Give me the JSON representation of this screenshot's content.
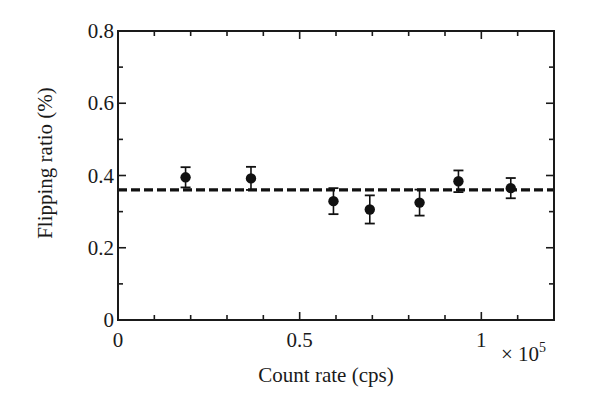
{
  "chart_data": {
    "type": "scatter",
    "title": "",
    "xlabel": "Count rate (cps)",
    "ylabel": "Flipping ratio (%)",
    "x_multiplier_label": "× 10",
    "x_multiplier_exponent": "5",
    "xlim": [
      0,
      1.2
    ],
    "ylim": [
      0,
      0.8
    ],
    "x_ticks": [
      0,
      0.5,
      1
    ],
    "x_tick_labels": [
      "0",
      "0.5",
      "1"
    ],
    "x_minor_step": 0.1,
    "y_ticks": [
      0,
      0.2,
      0.4,
      0.6,
      0.8
    ],
    "y_tick_labels": [
      "0",
      "0.2",
      "0.4",
      "0.6",
      "0.8"
    ],
    "y_minor_step": 0.1,
    "grid": false,
    "legend": null,
    "series": [
      {
        "name": "Flipping ratio",
        "marker": "filled-circle",
        "color": "#111111",
        "x": [
          0.186,
          0.366,
          0.593,
          0.693,
          0.83,
          0.937,
          1.081
        ],
        "y": [
          0.395,
          0.392,
          0.329,
          0.306,
          0.325,
          0.384,
          0.365
        ],
        "yerr": [
          0.028,
          0.032,
          0.036,
          0.039,
          0.036,
          0.03,
          0.028
        ]
      }
    ],
    "reference_line": {
      "style": "dashed",
      "orientation": "horizontal",
      "y": 0.36,
      "color": "#111111"
    }
  }
}
